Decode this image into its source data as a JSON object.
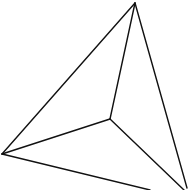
{
  "diagram": {
    "type": "tetrahedron-line-drawing",
    "stroke_color": "#111111",
    "background": "#ffffff",
    "vertices": {
      "top": [
        135,
        3
      ],
      "left": [
        2,
        154
      ],
      "inner": [
        110,
        119
      ],
      "bottom_right": [
        186,
        190
      ]
    },
    "edges": [
      {
        "from": "top",
        "to": "left",
        "x1": 135,
        "y1": 3,
        "x2": 2,
        "y2": 154
      },
      {
        "from": "top",
        "to": "inner",
        "x1": 135,
        "y1": 3,
        "x2": 110,
        "y2": 119
      },
      {
        "from": "top",
        "to": "bottom_right",
        "x1": 135,
        "y1": 3,
        "x2": 187,
        "y2": 188
      },
      {
        "from": "left",
        "to": "inner",
        "x1": 2,
        "y1": 154,
        "x2": 110,
        "y2": 119
      },
      {
        "from": "left",
        "to": "bottom_edge_exit",
        "x1": 2,
        "y1": 154,
        "x2": 150,
        "y2": 190
      },
      {
        "from": "inner",
        "to": "bottom_right",
        "x1": 110,
        "y1": 119,
        "x2": 184,
        "y2": 190
      }
    ]
  }
}
